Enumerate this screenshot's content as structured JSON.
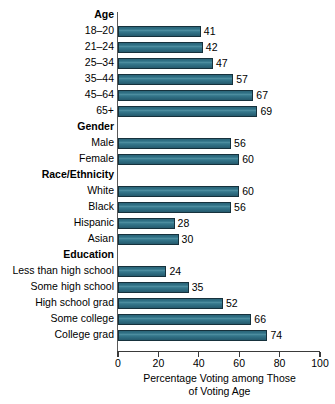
{
  "chart_data": {
    "type": "bar",
    "orientation": "horizontal",
    "title": "",
    "xlabel": "Percentage Voting among Those of Voting Age",
    "xlabel_lines": [
      "Percentage Voting among Those",
      "of Voting Age"
    ],
    "ylabel": "",
    "xlim": [
      0,
      100
    ],
    "xticks": [
      0,
      20,
      40,
      60,
      80,
      100
    ],
    "xtick_labels": [
      "0",
      "20",
      "40",
      "60",
      "80",
      "100"
    ],
    "grid": false,
    "legend": false,
    "bar_color": "#2f7085",
    "bar_edge_color": "#16313c",
    "groups": [
      {
        "name": "Age",
        "categories": [
          "18–20",
          "21–24",
          "25–34",
          "35–44",
          "45–64",
          "65+"
        ],
        "values": [
          41,
          42,
          47,
          57,
          67,
          69
        ]
      },
      {
        "name": "Gender",
        "categories": [
          "Male",
          "Female"
        ],
        "values": [
          56,
          60
        ]
      },
      {
        "name": "Race/Ethnicity",
        "categories": [
          "White",
          "Black",
          "Hispanic",
          "Asian"
        ],
        "values": [
          60,
          56,
          28,
          30
        ]
      },
      {
        "name": "Education",
        "categories": [
          "Less than high school",
          "Some high school",
          "High school grad",
          "Some college",
          "College grad"
        ],
        "values": [
          24,
          35,
          52,
          66,
          74
        ]
      }
    ]
  }
}
